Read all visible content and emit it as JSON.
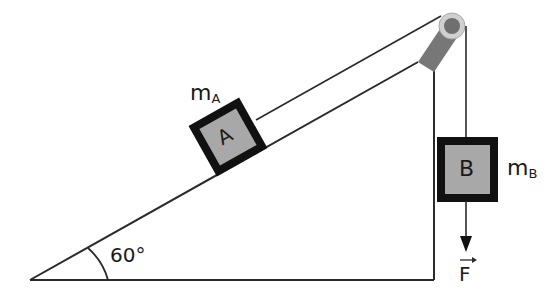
{
  "diagram": {
    "type": "physics-incline-pulley",
    "angle_label": "60°",
    "block_a": {
      "letter": "A",
      "mass_label": "m",
      "mass_sub": "A"
    },
    "block_b": {
      "letter": "B",
      "mass_label": "m",
      "mass_sub": "B"
    },
    "force_label": "F",
    "colors": {
      "line": "#2a2a2a",
      "block_fill": "#a8a8a8",
      "block_border": "#111111",
      "pulley_outer": "#d0d0d0",
      "pulley_inner": "#6f6f6f",
      "support": "#777777"
    }
  }
}
